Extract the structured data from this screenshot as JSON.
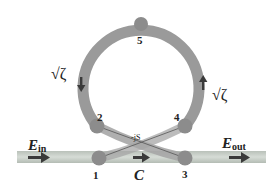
{
  "diagram": {
    "type": "ring-resonator-schematic",
    "colors": {
      "ring": "#9a9a9a",
      "ring_shadow": "#8a8a8a",
      "bus": "#c8cfc8",
      "bus_edge": "#b0b8b0",
      "node": "#8c8c8c",
      "arrow": "#3a3a3a",
      "text": "#222222"
    },
    "nodes": [
      {
        "id": "1",
        "label": "1"
      },
      {
        "id": "2",
        "label": "2"
      },
      {
        "id": "3",
        "label": "3"
      },
      {
        "id": "4",
        "label": "4"
      },
      {
        "id": "5",
        "label": "5"
      }
    ],
    "labels": {
      "input": {
        "main": "E",
        "sub": "in"
      },
      "output": {
        "main": "E",
        "sub": "out"
      },
      "coupler_through": "C",
      "coupler_cross": "-jS",
      "loss_left": "√ζ",
      "loss_right": "√ζ"
    }
  }
}
